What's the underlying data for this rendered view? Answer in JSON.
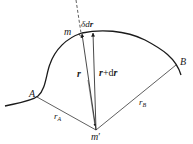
{
  "diagram": {
    "colors": {
      "stroke": "#1a1a1a",
      "background": "#ffffff"
    },
    "points": {
      "A": {
        "label": "A"
      },
      "B": {
        "label": "B"
      },
      "m": {
        "label": "m"
      },
      "m_prime": {
        "label": "m",
        "prime": "′"
      }
    },
    "vectors": {
      "r": {
        "label": "r"
      },
      "r_plus_dr": {
        "label_r": "r",
        "label_plus": "+d",
        "label_r2": "r"
      },
      "delta_dr": {
        "label_delta": "δd",
        "label_r": "r"
      }
    },
    "radii": {
      "rA": {
        "base": "r",
        "sub": "A"
      },
      "rB": {
        "base": "r",
        "sub": "B"
      }
    }
  }
}
